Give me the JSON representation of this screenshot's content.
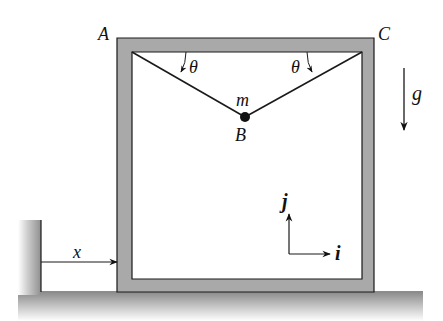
{
  "diagram": {
    "points": {
      "A": "A",
      "B": "B",
      "C": "C"
    },
    "mass_label": "m",
    "angle_left_label": "θ",
    "angle_right_label": "θ",
    "gravity_label": "g",
    "displacement_label": "x",
    "unit_vector_i": "i",
    "unit_vector_j": "j",
    "colors": {
      "frame_fill": "#a9a9a9",
      "line": "#1a1a1a",
      "ground_shade": "#9a9a9a",
      "background": "#ffffff"
    }
  }
}
